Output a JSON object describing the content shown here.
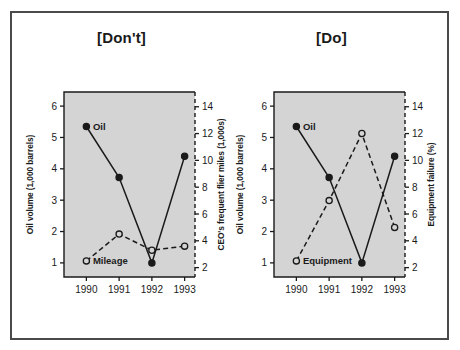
{
  "figure": {
    "panels": [
      {
        "key": "dont",
        "title": "[Don't]",
        "chart_data": {
          "type": "line",
          "title": "[Don't]",
          "xlabel": "",
          "ylabel": "Oil volume (1,000 barrels)",
          "y2label": "CEO's frequent flier miles (1,000s)",
          "categories": [
            "1990",
            "1991",
            "1992",
            "1993"
          ],
          "xticklabels": [
            "1990",
            "1991",
            "1992",
            "1993"
          ],
          "yticklabels": [
            "1",
            "2",
            "3",
            "4",
            "5",
            "6"
          ],
          "ylim": [
            0.55,
            6.45
          ],
          "y2ticklabels": [
            "2",
            "4",
            "6",
            "8",
            "10",
            "12",
            "14"
          ],
          "y2lim": [
            1.3,
            15.1
          ],
          "grid": false,
          "legend": "inline-labels",
          "series": [
            {
              "name": "Oil",
              "label": "Oil",
              "axis": "left",
              "marker": "filled-circle",
              "line": "solid",
              "values": [
                5.35,
                3.72,
                1.0,
                4.4
              ]
            },
            {
              "name": "Mileage",
              "label": "Mileage",
              "axis": "right",
              "marker": "open-circle",
              "line": "dashed",
              "values": [
                2.5,
                4.5,
                3.3,
                3.6
              ]
            }
          ]
        }
      },
      {
        "key": "do",
        "title": "[Do]",
        "chart_data": {
          "type": "line",
          "title": "[Do]",
          "xlabel": "",
          "ylabel": "Oil volume (1,000 barrels)",
          "y2label": "Equipment failure (%)",
          "categories": [
            "1990",
            "1991",
            "1992",
            "1993"
          ],
          "xticklabels": [
            "1990",
            "1991",
            "1992",
            "1993"
          ],
          "yticklabels": [
            "1",
            "2",
            "3",
            "4",
            "5",
            "6"
          ],
          "ylim": [
            0.55,
            6.45
          ],
          "y2ticklabels": [
            "2",
            "4",
            "6",
            "8",
            "10",
            "12",
            "14"
          ],
          "y2lim": [
            1.3,
            15.1
          ],
          "grid": false,
          "legend": "inline-labels",
          "series": [
            {
              "name": "Oil",
              "label": "Oil",
              "axis": "left",
              "marker": "filled-circle",
              "line": "solid",
              "values": [
                5.35,
                3.72,
                1.0,
                4.4
              ]
            },
            {
              "name": "Equipment",
              "label": "Equipment",
              "axis": "right",
              "marker": "open-circle",
              "line": "dashed",
              "values": [
                2.5,
                7.0,
                12.0,
                5.0
              ]
            }
          ]
        }
      }
    ],
    "colors": {
      "plot_background": "#d4d4d4",
      "axis": "#1a1a1a",
      "frame": "#4a4a4a",
      "page_background": "#ffffff",
      "marker_fill_solid": "#1a1a1a",
      "marker_fill_open": "#d4d4d4"
    }
  }
}
